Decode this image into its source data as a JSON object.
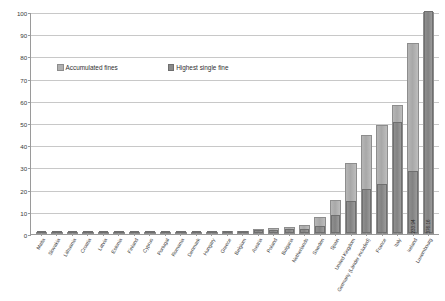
{
  "chart_data": {
    "type": "bar",
    "title": "",
    "xlabel": "",
    "ylabel": "",
    "ylim": [
      0,
      100
    ],
    "yticks": [
      0,
      10,
      20,
      30,
      40,
      50,
      60,
      70,
      80,
      90,
      100
    ],
    "grid": true,
    "legend_position": "upper-left-inside",
    "categories": [
      "Malta",
      "Slovakia",
      "Lithuania",
      "Croatia",
      "Latvia",
      "Estonia",
      "Finland",
      "Cyprus",
      "Portugal",
      "Romania",
      "Denmark",
      "Hungary",
      "Greece",
      "Belgium",
      "Austria",
      "Poland",
      "Bulgaria",
      "Netherlands",
      "Sweden",
      "Spain",
      "United Kingdom",
      "Germany (Länder included)",
      "France",
      "Italy",
      "Ireland",
      "Luxembourg"
    ],
    "series": [
      {
        "name": "Accumulated fines",
        "values": [
          0.1,
          0.2,
          0.3,
          0.3,
          0.4,
          0.5,
          0.6,
          0.7,
          0.8,
          0.9,
          1.0,
          1.1,
          1.2,
          1.4,
          2.4,
          2.6,
          3.2,
          4.0,
          7.5,
          15.5,
          32.0,
          44.5,
          49.0,
          58.0,
          86.0,
          100.0
        ]
      },
      {
        "name": "Highest single fine",
        "values": [
          0.05,
          0.1,
          0.15,
          0.2,
          0.2,
          0.3,
          0.3,
          0.4,
          0.4,
          0.5,
          0.5,
          0.6,
          0.7,
          0.8,
          1.2,
          1.3,
          1.6,
          2.0,
          3.0,
          8.0,
          14.5,
          20.0,
          22.0,
          50.0,
          28.0,
          100.0
        ]
      }
    ],
    "bar_value_labels": [
      {
        "index": 24,
        "text": "233.94"
      },
      {
        "index": 25,
        "text": "376.16"
      }
    ]
  },
  "legend": {
    "items": [
      {
        "label": "Accumulated fines",
        "swatch": "accumulated-fines-swatch",
        "color": "#b0b0b0"
      },
      {
        "label": "Highest single fine",
        "swatch": "highest-single-fine-swatch",
        "color": "#8a8a8a"
      }
    ]
  },
  "colors": {
    "accumulated_fines": "#b0b0b0",
    "highest_single_fine": "#8a8a8a",
    "gridline": "#c8c8c8",
    "axis": "#9a9a9a",
    "background": "#ffffff",
    "text": "#3a3a3a"
  }
}
